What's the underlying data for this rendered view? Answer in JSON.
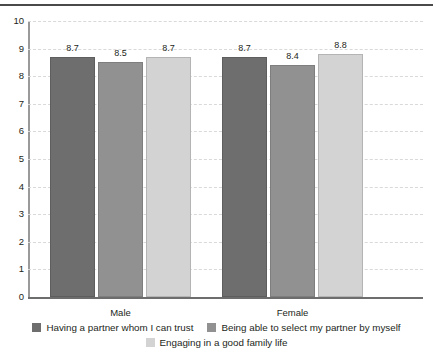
{
  "chart_data": {
    "type": "bar",
    "title": "",
    "xlabel": "",
    "ylabel": "",
    "ylim": [
      0,
      10
    ],
    "y_ticks": [
      "10",
      "9",
      "8",
      "7",
      "6",
      "5",
      "4",
      "3",
      "2",
      "1",
      "0"
    ],
    "grid": true,
    "legend_position": "bottom",
    "categories": [
      "Male",
      "Female"
    ],
    "series": [
      {
        "name": "Having a partner whom I can trust",
        "color": "#6e6e6e",
        "values": [
          8.7,
          8.7
        ],
        "labels": [
          "8.7",
          "8.7"
        ]
      },
      {
        "name": "Being able to select my partner by myself",
        "color": "#919191",
        "values": [
          8.5,
          8.4
        ],
        "labels": [
          "8.5",
          "8.4"
        ]
      },
      {
        "name": "Engaging in a good family life",
        "color": "#d3d3d3",
        "values": [
          8.7,
          8.8
        ],
        "labels": [
          "8.7",
          "8.8"
        ]
      }
    ]
  }
}
